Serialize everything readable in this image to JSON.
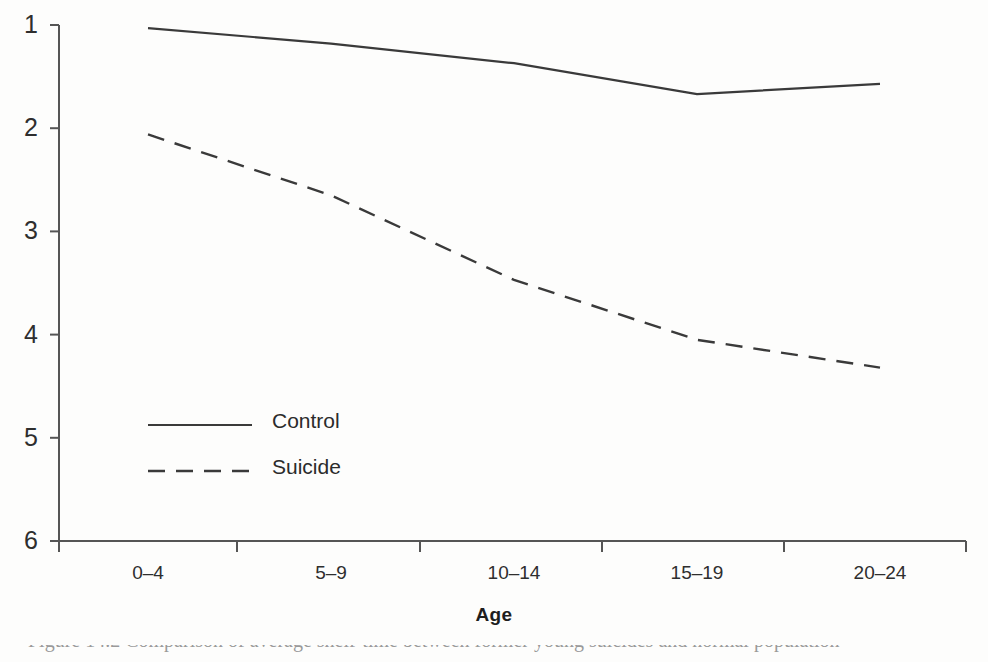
{
  "figure": {
    "axis_title_x": "Age",
    "axis_title_y": "",
    "caption_partial": "Figure 14.2  Comparison of average shelf-time between former young suicides and normal population"
  },
  "legend": {
    "entries": [
      {
        "label": "Control",
        "style": "solid"
      },
      {
        "label": "Suicide",
        "style": "dashed"
      }
    ]
  },
  "axes": {
    "y_ticks": [
      "6",
      "5",
      "4",
      "3",
      "2",
      "1"
    ],
    "x_ticks": [
      "0–4",
      "5–9",
      "10–14",
      "15–19",
      "20–24"
    ]
  },
  "colors": {
    "ink": "#3a3a3a",
    "axis": "#555555",
    "background": "#fdfdfc"
  },
  "chart_data": {
    "type": "line",
    "title": "",
    "xlabel": "Age",
    "ylabel": "",
    "categories": [
      "0–4",
      "5–9",
      "10–14",
      "15–19",
      "20–24"
    ],
    "ylim": [
      1,
      6
    ],
    "y_ticks": [
      1,
      2,
      3,
      4,
      5,
      6
    ],
    "grid": false,
    "legend_position": "inside-lower-left",
    "series": [
      {
        "name": "Control",
        "style": "solid",
        "values": [
          5.97,
          5.82,
          5.63,
          5.33,
          5.43
        ]
      },
      {
        "name": "Suicide",
        "style": "dashed",
        "values": [
          4.94,
          4.35,
          3.53,
          2.95,
          2.68
        ]
      }
    ]
  }
}
